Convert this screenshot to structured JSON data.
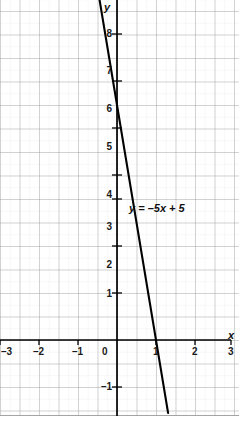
{
  "chart_data": {
    "type": "line",
    "title": "",
    "xlabel": "x",
    "ylabel": "y",
    "annotations": [
      {
        "name": "equation-label",
        "text": "y = –5x + 5",
        "x": 0.45,
        "y": 3.35
      }
    ],
    "equation": "y = -5x + 5",
    "slope": -5,
    "intercept": 5,
    "x_intercept": 1,
    "y_intercept": 5,
    "xlim": [
      -3,
      3
    ],
    "ylim": [
      -1.6,
      9.2
    ],
    "grid": true,
    "grid_major_step": 0.5,
    "grid_minor_step": 0.25,
    "legend": "none",
    "x_ticks": [
      -3,
      -2,
      -1,
      0,
      1,
      2,
      3
    ],
    "x_tick_labels": [
      "–3",
      "–2",
      "–1",
      "0",
      "1",
      "2",
      "3"
    ],
    "y_ticks": [
      -1,
      1,
      2,
      3,
      4,
      5,
      6,
      7,
      8
    ],
    "y_tick_labels": [
      "–1",
      "1",
      "2",
      "3",
      "4",
      "5",
      "6",
      "7",
      "8"
    ],
    "series": [
      {
        "name": "y = -5x + 5",
        "points": [
          [
            -0.82,
            9.1
          ],
          [
            1.31,
            -1.55
          ]
        ],
        "color": "#000000"
      }
    ]
  },
  "axes": {
    "x_axis_name": "x",
    "y_axis_name": "y",
    "axis_color": "#000000",
    "grid_major_color": "#9a9a9a",
    "grid_minor_color": "#cfcfd4",
    "background": "#ffffff",
    "line_color": "#000000"
  },
  "x_labels": [
    {
      "text": "–3",
      "value": -3
    },
    {
      "text": "–2",
      "value": -2
    },
    {
      "text": "–1",
      "value": -1
    },
    {
      "text": "0",
      "value": 0
    },
    {
      "text": "1",
      "value": 1
    },
    {
      "text": "2",
      "value": 2
    },
    {
      "text": "3",
      "value": 3
    }
  ],
  "y_labels": [
    {
      "text": "8",
      "value": 8
    },
    {
      "text": "7",
      "value": 7
    },
    {
      "text": "6",
      "value": 6
    },
    {
      "text": "5",
      "value": 5
    },
    {
      "text": "4",
      "value": 4
    },
    {
      "text": "3",
      "value": 3
    },
    {
      "text": "2",
      "value": 2
    },
    {
      "text": "1",
      "value": 1
    },
    {
      "text": "–1",
      "value": -1
    }
  ],
  "equation_label": "y = –5x + 5"
}
